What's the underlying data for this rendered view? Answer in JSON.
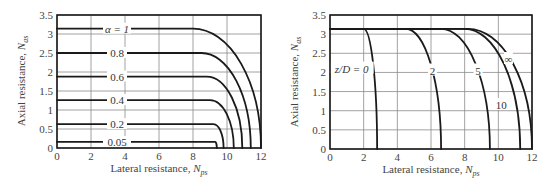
{
  "chart_data": [
    {
      "type": "line",
      "title": "",
      "xlabel": "Lateral resistance, N_ps",
      "ylabel": "Axial resistance, N_as",
      "xlabel_main": "Lateral resistance, ",
      "xlabel_sym": "N",
      "xlabel_sub": "ps",
      "ylabel_main": "Axial resistance, ",
      "ylabel_sym": "N",
      "ylabel_sub": "as",
      "xlim": [
        0,
        12
      ],
      "ylim": [
        0,
        3.5
      ],
      "xticks": [
        "0",
        "2",
        "4",
        "6",
        "8",
        "10",
        "12"
      ],
      "yticks": [
        "0",
        "0.5",
        "1",
        "1.5",
        "2",
        "2.5",
        "3",
        "3.5"
      ],
      "grid": true,
      "legend_param": "α",
      "series": [
        {
          "name": "α = 1",
          "label": "α = 1",
          "plateau": 3.14,
          "bend_start_x": 8.0,
          "x_at_zero": 12.0
        },
        {
          "name": "0.8",
          "label": "0.8",
          "plateau": 2.5,
          "bend_start_x": 8.5,
          "x_at_zero": 11.4
        },
        {
          "name": "0.6",
          "label": "0.6",
          "plateau": 1.88,
          "bend_start_x": 8.8,
          "x_at_zero": 10.9
        },
        {
          "name": "0.4",
          "label": "0.4",
          "plateau": 1.26,
          "bend_start_x": 9.0,
          "x_at_zero": 10.4
        },
        {
          "name": "0.2",
          "label": "0.2",
          "plateau": 0.63,
          "bend_start_x": 9.2,
          "x_at_zero": 9.8
        },
        {
          "name": "0.05",
          "label": "0.05",
          "plateau": 0.16,
          "bend_start_x": 9.3,
          "x_at_zero": 9.4
        }
      ]
    },
    {
      "type": "line",
      "title": "",
      "xlabel": "Lateral resistance, N_ps",
      "ylabel": "Axial resistance, N_as",
      "xlabel_main": "Lateral resistance, ",
      "xlabel_sym": "N",
      "xlabel_sub": "ps",
      "ylabel_main": "Axial resistance, ",
      "ylabel_sym": "N",
      "ylabel_sub": "as",
      "xlim": [
        0,
        12
      ],
      "ylim": [
        0,
        3.5
      ],
      "xticks": [
        "0",
        "2",
        "4",
        "6",
        "8",
        "10",
        "12"
      ],
      "yticks": [
        "0",
        "0.5",
        "1",
        "1.5",
        "2",
        "2.5",
        "3",
        "3.5"
      ],
      "grid": true,
      "legend_param": "z/D",
      "series": [
        {
          "name": "z/D = 0",
          "label": "z/D = 0",
          "plateau": 3.14,
          "bend_start_x": 2.0,
          "x_at_zero": 2.8
        },
        {
          "name": "2",
          "label": "2",
          "plateau": 3.14,
          "bend_start_x": 4.5,
          "x_at_zero": 6.6
        },
        {
          "name": "5",
          "label": "5",
          "plateau": 3.14,
          "bend_start_x": 6.6,
          "x_at_zero": 9.5
        },
        {
          "name": "10",
          "label": "10",
          "plateau": 3.14,
          "bend_start_x": 8.0,
          "x_at_zero": 11.3
        },
        {
          "name": "∞",
          "label": "∞",
          "plateau": 3.14,
          "bend_start_x": 8.2,
          "x_at_zero": 12.0
        }
      ]
    }
  ]
}
